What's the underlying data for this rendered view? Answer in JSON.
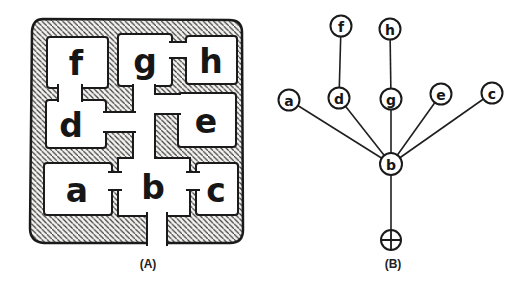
{
  "figure": {
    "background": "#ffffff",
    "ink_color": "#1a1a1a",
    "caption_a": "(A)",
    "caption_b": "(B)"
  },
  "plan": {
    "description_rooms": "floor plan with hatched walls and door openings",
    "rooms": [
      {
        "id": "f",
        "label": "f"
      },
      {
        "id": "g",
        "label": "g"
      },
      {
        "id": "h",
        "label": "h"
      },
      {
        "id": "d",
        "label": "d"
      },
      {
        "id": "e",
        "label": "e"
      },
      {
        "id": "a",
        "label": "a"
      },
      {
        "id": "b",
        "label": "b"
      },
      {
        "id": "c",
        "label": "c"
      }
    ],
    "doors": [
      "f-d",
      "g-h",
      "g-b",
      "d-b",
      "e-b",
      "a-b",
      "b-c",
      "b-entrance"
    ]
  },
  "graph": {
    "nodes": [
      {
        "id": "f",
        "label": "f"
      },
      {
        "id": "h",
        "label": "h"
      },
      {
        "id": "a",
        "label": "a"
      },
      {
        "id": "d",
        "label": "d"
      },
      {
        "id": "g",
        "label": "g"
      },
      {
        "id": "e",
        "label": "e"
      },
      {
        "id": "c",
        "label": "c"
      },
      {
        "id": "b",
        "label": "b"
      },
      {
        "id": "root",
        "label": "",
        "symbol": "circled-plus-entrance"
      }
    ],
    "edges": [
      [
        "f",
        "d"
      ],
      [
        "h",
        "g"
      ],
      [
        "a",
        "b"
      ],
      [
        "d",
        "b"
      ],
      [
        "g",
        "b"
      ],
      [
        "e",
        "b"
      ],
      [
        "c",
        "b"
      ],
      [
        "b",
        "root"
      ]
    ]
  }
}
